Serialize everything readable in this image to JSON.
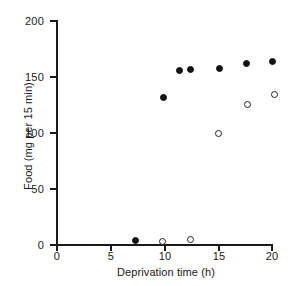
{
  "chart_data": {
    "type": "scatter",
    "title": "",
    "xlabel": "Deprivation time (h)",
    "ylabel": "Food (mg per 15 min)",
    "xlim": [
      0,
      20
    ],
    "ylim": [
      0,
      200
    ],
    "xticks": [
      0,
      5,
      10,
      15,
      20
    ],
    "yticks": [
      0,
      50,
      100,
      150,
      200
    ],
    "xtick_labels": [
      "0",
      "5",
      "10",
      "15",
      "20"
    ],
    "ytick_labels": [
      "0",
      "50",
      "100",
      "150",
      "200"
    ],
    "grid": false,
    "legend": "none",
    "series": [
      {
        "name": "filled-circles",
        "marker": "filled-circle",
        "color": "#111111",
        "points": [
          {
            "x": 7.3,
            "y": 4
          },
          {
            "x": 9.9,
            "y": 131
          },
          {
            "x": 11.4,
            "y": 155
          },
          {
            "x": 12.4,
            "y": 156
          },
          {
            "x": 15.1,
            "y": 157
          },
          {
            "x": 17.6,
            "y": 161
          },
          {
            "x": 20.0,
            "y": 163
          }
        ]
      },
      {
        "name": "open-circles",
        "marker": "open-circle",
        "color": "#ffffff",
        "points": [
          {
            "x": 9.8,
            "y": 3
          },
          {
            "x": 12.4,
            "y": 5
          },
          {
            "x": 15.0,
            "y": 99
          },
          {
            "x": 17.7,
            "y": 125
          },
          {
            "x": 20.2,
            "y": 134
          }
        ]
      }
    ]
  },
  "axes": {
    "x_title": "Deprivation time (h)",
    "y_title": "Food (mg per 15 min)"
  }
}
